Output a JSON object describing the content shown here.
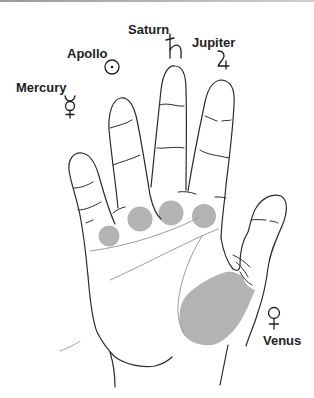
{
  "diagram": {
    "colors": {
      "mount_fill": "#b3b3b3",
      "outline": "#2b2b2b",
      "palm_lines": "#9e9e9e",
      "label_text": "#222222"
    },
    "mounts": [
      {
        "label": "Mercury",
        "symbol": "mercury-symbol",
        "finger": "little"
      },
      {
        "label": "Apollo",
        "symbol": "sun-symbol",
        "finger": "ring"
      },
      {
        "label": "Saturn",
        "symbol": "saturn-symbol",
        "finger": "middle"
      },
      {
        "label": "Jupiter",
        "symbol": "jupiter-symbol",
        "finger": "index"
      },
      {
        "label": "Venus",
        "symbol": "venus-symbol",
        "finger": "thumb"
      }
    ]
  }
}
